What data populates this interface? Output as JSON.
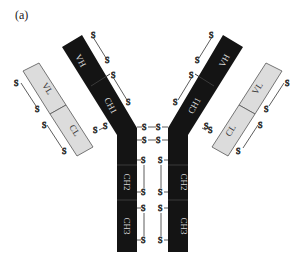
{
  "figure": {
    "panel_label": "(a)"
  },
  "colors": {
    "heavy_chain": "#141414",
    "light_chain": "#dcdcdc",
    "light_chain_border": "#555555",
    "heavy_label": "#d8d8d8",
    "light_label": "#333333",
    "bond": "#333333"
  },
  "domains": {
    "heavy_variable": "VH",
    "heavy_constant_1": "CH1",
    "heavy_constant_2": "CH2",
    "heavy_constant_3": "CH3",
    "light_variable": "VL",
    "light_constant": "CL"
  },
  "bond_label": "S"
}
